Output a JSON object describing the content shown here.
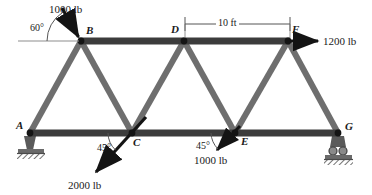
{
  "figure": {
    "type": "truss-free-body-diagram",
    "colors": {
      "chord": "#3c3c3c",
      "diagonal": "#6e6e6e",
      "node": "#141414",
      "arrow": "#141414",
      "support": "#5a5a5a",
      "dimension": "#555555",
      "background": "#ffffff"
    }
  },
  "nodes": [
    {
      "id": "A",
      "label": "A",
      "x": 30,
      "y": 133,
      "label_x": 16,
      "label_y": 120
    },
    {
      "id": "B",
      "label": "B",
      "x": 81,
      "y": 41,
      "label_x": 86,
      "label_y": 25
    },
    {
      "id": "C",
      "label": "C",
      "x": 132,
      "y": 133,
      "label_x": 133,
      "label_y": 137
    },
    {
      "id": "D",
      "label": "D",
      "x": 184,
      "y": 41,
      "label_x": 171,
      "label_y": 24
    },
    {
      "id": "E",
      "label": "E",
      "x": 235,
      "y": 133,
      "label_x": 241,
      "label_y": 136
    },
    {
      "id": "F",
      "label": "F",
      "x": 288,
      "y": 41,
      "label_x": 292,
      "label_y": 24
    },
    {
      "id": "G",
      "label": "G",
      "x": 338,
      "y": 133,
      "label_x": 345,
      "label_y": 121
    }
  ],
  "members": [
    {
      "name": "top-chord-B-F",
      "from": "B",
      "to": "F",
      "style": "chord"
    },
    {
      "name": "bottom-chord-A-G",
      "from": "A",
      "to": "G",
      "style": "chord"
    },
    {
      "name": "diagonal-A-B",
      "from": "A",
      "to": "B",
      "style": "diagonal"
    },
    {
      "name": "diagonal-B-C",
      "from": "B",
      "to": "C",
      "style": "diagonal"
    },
    {
      "name": "diagonal-C-D",
      "from": "C",
      "to": "D",
      "style": "diagonal"
    },
    {
      "name": "diagonal-D-E",
      "from": "D",
      "to": "E",
      "style": "diagonal"
    },
    {
      "name": "diagonal-E-F",
      "from": "E",
      "to": "F",
      "style": "diagonal"
    },
    {
      "name": "diagonal-F-G",
      "from": "F",
      "to": "G",
      "style": "diagonal"
    }
  ],
  "loads": [
    {
      "name": "load-at-B",
      "label": "1000 lb",
      "magnitude": 1000,
      "unit": "lb",
      "angle_label": "60°",
      "angle_deg": 60,
      "direction": "down-right onto joint B",
      "at_node": "B",
      "label_x": 49,
      "label_y": 4,
      "angle_label_x": 30,
      "angle_label_y": 23
    },
    {
      "name": "load-at-F",
      "label": "1200 lb",
      "magnitude": 1200,
      "unit": "lb",
      "angle_label": "",
      "angle_deg": 0,
      "direction": "horizontal right from joint F",
      "at_node": "F",
      "label_x": 323,
      "label_y": 36,
      "angle_label_x": 0,
      "angle_label_y": 0
    },
    {
      "name": "load-at-C",
      "label": "2000 lb",
      "magnitude": 2000,
      "unit": "lb",
      "angle_label": "45°",
      "angle_deg": 45,
      "direction": "down-left from joint C",
      "at_node": "C",
      "label_x": 68,
      "label_y": 180,
      "angle_label_x": 97,
      "angle_label_y": 143
    },
    {
      "name": "load-at-E",
      "label": "1000 lb",
      "magnitude": 1000,
      "unit": "lb",
      "angle_label": "45°",
      "angle_deg": 45,
      "direction": "down-left from joint E",
      "at_node": "E",
      "label_x": 194,
      "label_y": 155,
      "angle_label_x": 196,
      "angle_label_y": 141
    }
  ],
  "dimension": {
    "name": "span-D-to-F",
    "label": "10 ft",
    "value": 10,
    "unit": "ft",
    "from_x": 185,
    "to_x": 290,
    "y": 24,
    "label_x": 216,
    "label_y": 18
  },
  "supports": [
    {
      "name": "pin-support-A",
      "type": "pin",
      "at_node": "A",
      "x": 30,
      "y": 133
    },
    {
      "name": "roller-support-G",
      "type": "roller",
      "at_node": "G",
      "x": 338,
      "y": 133
    }
  ]
}
